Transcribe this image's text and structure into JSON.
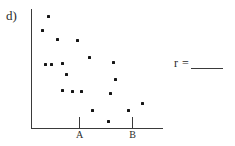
{
  "figure": {
    "part_label": "d)",
    "answer": {
      "symbol": "r =",
      "value": "",
      "blank": true
    }
  },
  "chart_data": {
    "type": "scatter",
    "title": "",
    "subtitle": "",
    "xlabel": "",
    "ylabel": "",
    "legend": [],
    "grid": false,
    "axes": {
      "x_axis_visible": true,
      "y_axis_visible": true,
      "x_tick_labels": [
        "A",
        "B"
      ],
      "y_tick_labels": [],
      "x_tick_positions_px": [
        79,
        132
      ],
      "origin_px": [
        31,
        128
      ],
      "x_axis_end_px": [
        163,
        128
      ],
      "y_axis_top_px": [
        31,
        9
      ]
    },
    "point_marker": "filled-square",
    "point_color": "#161616",
    "n_points": 19,
    "relationship": "negative",
    "points_px": [
      [
        48,
        16
      ],
      [
        42,
        30
      ],
      [
        57,
        39
      ],
      [
        77,
        40
      ],
      [
        89,
        57
      ],
      [
        45,
        64
      ],
      [
        62,
        63
      ],
      [
        113,
        62
      ],
      [
        66,
        74
      ],
      [
        115,
        79
      ],
      [
        62,
        90
      ],
      [
        81,
        91
      ],
      [
        110,
        93
      ],
      [
        92,
        110
      ],
      [
        128,
        110
      ],
      [
        142,
        103
      ],
      [
        108,
        121
      ],
      [
        51,
        64
      ],
      [
        72,
        91
      ]
    ],
    "points": [
      {
        "x": 0.13,
        "y": 0.94
      },
      {
        "x": 0.08,
        "y": 0.82
      },
      {
        "x": 0.2,
        "y": 0.75
      },
      {
        "x": 0.35,
        "y": 0.74
      },
      {
        "x": 0.44,
        "y": 0.6
      },
      {
        "x": 0.11,
        "y": 0.54
      },
      {
        "x": 0.23,
        "y": 0.55
      },
      {
        "x": 0.62,
        "y": 0.55
      },
      {
        "x": 0.27,
        "y": 0.45
      },
      {
        "x": 0.64,
        "y": 0.41
      },
      {
        "x": 0.23,
        "y": 0.32
      },
      {
        "x": 0.38,
        "y": 0.31
      },
      {
        "x": 0.6,
        "y": 0.29
      },
      {
        "x": 0.46,
        "y": 0.15
      },
      {
        "x": 0.73,
        "y": 0.15
      },
      {
        "x": 0.84,
        "y": 0.21
      },
      {
        "x": 0.58,
        "y": 0.06
      },
      {
        "x": 0.15,
        "y": 0.54
      },
      {
        "x": 0.31,
        "y": 0.31
      }
    ]
  }
}
